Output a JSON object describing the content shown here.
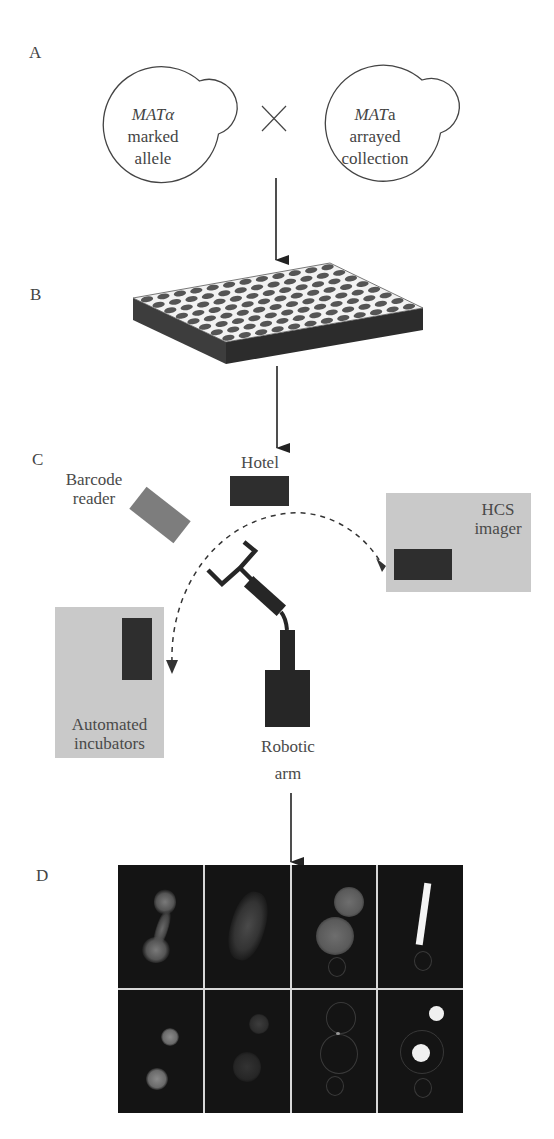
{
  "figure": {
    "panels": [
      {
        "id": "A",
        "label": "A"
      },
      {
        "id": "B",
        "label": "B"
      },
      {
        "id": "C",
        "label": "C"
      },
      {
        "id": "D",
        "label": "D"
      }
    ],
    "panel_a": {
      "cell_left": {
        "genotype": "MATα",
        "genotype_italic": "MAT",
        "genotype_suffix": "α",
        "line2": "marked",
        "line3": "allele"
      },
      "cell_right": {
        "genotype": "MATa",
        "genotype_italic": "MAT",
        "genotype_suffix": "a",
        "line2": "arrayed",
        "line3": "collection"
      },
      "cross_symbol": "×"
    },
    "panel_b": {
      "object": "96-well plate",
      "rows": 8,
      "columns": 12
    },
    "panel_c": {
      "components": {
        "barcode_reader": {
          "line1": "Barcode",
          "line2": "reader"
        },
        "hotel": {
          "label": "Hotel"
        },
        "hcs_imager": {
          "line1": "HCS",
          "line2": "imager"
        },
        "incubators": {
          "line1": "Automated",
          "line2": "incubators"
        },
        "robotic_arm": {
          "line1": "Robotic",
          "line2": "arm"
        }
      }
    },
    "panel_d": {
      "image_grid": {
        "rows": 2,
        "columns": 4,
        "description": "fluorescence microscopy images of yeast cells"
      }
    },
    "colors": {
      "dark_block": "#2e2e2e",
      "gray_block": "#7a7a7a",
      "light_box": "#c9c9c9",
      "arrow": "#222222",
      "micro_bg": "#141414"
    }
  }
}
